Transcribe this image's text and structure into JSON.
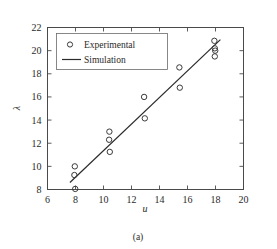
{
  "figure": {
    "caption": "(a)"
  },
  "chart_data": {
    "type": "scatter",
    "title": "",
    "subtitle": "",
    "xlabel": "u",
    "ylabel": "λ",
    "xlim": [
      6,
      20
    ],
    "ylim": [
      8,
      22
    ],
    "xticks": [
      6,
      8,
      10,
      12,
      14,
      16,
      18,
      20
    ],
    "yticks": [
      8,
      10,
      12,
      14,
      16,
      18,
      20,
      22
    ],
    "xtick_labels": [
      "6",
      "8",
      "10",
      "12",
      "14",
      "16",
      "18",
      "20"
    ],
    "ytick_labels": [
      "8",
      "10",
      "12",
      "14",
      "16",
      "18",
      "20",
      "22"
    ],
    "grid": false,
    "legend_position": "upper left",
    "legend": [
      {
        "label": "Experimental",
        "marker": "circle-open",
        "color": "#3a3a3a"
      },
      {
        "label": "Simulation",
        "marker": "line",
        "color": "#2b2b2b"
      }
    ],
    "series": [
      {
        "name": "Experimental",
        "type": "scatter",
        "marker": "circle-open",
        "color": "#3a3a3a",
        "points": [
          {
            "x": 7.95,
            "y": 10.0
          },
          {
            "x": 7.92,
            "y": 9.25
          },
          {
            "x": 7.98,
            "y": 8.05
          },
          {
            "x": 10.42,
            "y": 13.0
          },
          {
            "x": 10.4,
            "y": 12.3
          },
          {
            "x": 10.45,
            "y": 11.25
          },
          {
            "x": 12.9,
            "y": 16.0
          },
          {
            "x": 12.95,
            "y": 14.15
          },
          {
            "x": 15.42,
            "y": 18.55
          },
          {
            "x": 15.45,
            "y": 16.8
          },
          {
            "x": 17.92,
            "y": 20.85
          },
          {
            "x": 17.95,
            "y": 20.2
          },
          {
            "x": 17.98,
            "y": 20.0
          },
          {
            "x": 17.95,
            "y": 19.5
          }
        ]
      },
      {
        "name": "Simulation",
        "type": "line",
        "color": "#2b2b2b",
        "points": [
          {
            "x": 7.6,
            "y": 8.6
          },
          {
            "x": 18.35,
            "y": 20.95
          }
        ]
      }
    ]
  }
}
